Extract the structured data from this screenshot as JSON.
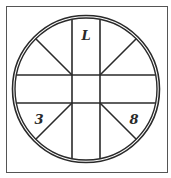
{
  "diagram": {
    "labels": {
      "top": "L",
      "bottom_left": "3",
      "bottom_right": "8"
    },
    "colors": {
      "line": "#2a2a2a",
      "frame": "#555555",
      "background": "#ffffff"
    }
  }
}
